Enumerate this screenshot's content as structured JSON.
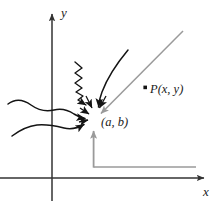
{
  "figure": {
    "background_color": "#ffffff"
  },
  "axes": {
    "x_label": "x",
    "y_label": "y",
    "axis_color": "#333333",
    "origin": {
      "x": 52,
      "y": 178
    },
    "x_axis": {
      "x1": 0,
      "y1": 178,
      "x2": 206,
      "y2": 178
    },
    "y_axis": {
      "x1": 52,
      "y1": 200,
      "x2": 52,
      "y2": 12
    }
  },
  "labels": {
    "point_p": "P(x, y)",
    "point_limit": "(a, b)",
    "x_axis": "x",
    "y_axis": "y"
  },
  "points": {
    "p": {
      "x": 146,
      "y": 88,
      "label": "P(x, y)",
      "marker_color": "#1a1a1a"
    },
    "limit": {
      "x": 96,
      "y": 118,
      "label": "(a, b)"
    }
  },
  "guides": {
    "color": "#9a9a9a",
    "vertical": {
      "x": 93,
      "y_bottom": 166,
      "y_top": 128
    },
    "horizontal": {
      "y": 167,
      "x_left": 93,
      "x_right": 196
    },
    "secant": {
      "x1": 97,
      "y1": 117,
      "x2": 182,
      "y2": 32
    }
  },
  "curves": {
    "color": "#1a1a1a",
    "approach_curve": "curve-from-upper-right",
    "zigzag": "zigzag-approach-path",
    "wavy_upper": "wavy-approach-path-upper-left",
    "wavy_lower": "wavy-approach-path-lower-left"
  },
  "colors": {
    "ink": "#1a1a1a",
    "axis": "#333333",
    "guide_gray": "#9a9a9a",
    "background": "#ffffff"
  }
}
